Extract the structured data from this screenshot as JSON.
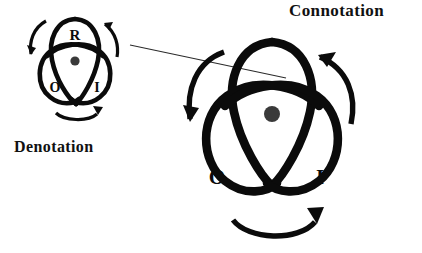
{
  "figure": {
    "title_visible": false,
    "background_color": "#ffffff",
    "ink_color": "#0b0b0b",
    "center_dot_color": "#3a3a3a",
    "pointer_line_color": "#2b2b2b"
  },
  "labels": {
    "connotation": "Connotation",
    "denotation": "Denotation"
  },
  "small_knot": {
    "name": "denotation-knot",
    "letters": {
      "top": "R",
      "bottom_left": "O",
      "bottom_right": "I"
    },
    "center_dot": true,
    "arrow_arcs": 3
  },
  "large_knot": {
    "name": "connotation-knot",
    "letters": {
      "top": "",
      "bottom_left": "O",
      "bottom_right": "I"
    },
    "center_dot": true,
    "arrow_arcs": 3
  },
  "pointer_line": {
    "from": "denotation-knot",
    "to": "connotation-knot"
  }
}
